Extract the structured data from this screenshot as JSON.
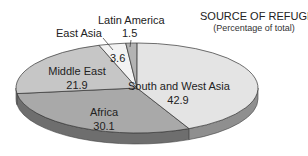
{
  "chart_data": {
    "type": "pie",
    "title": "SOURCE OF REFUGEES",
    "subtitle": "(Percentage of total)",
    "style": "3d",
    "categories": [
      "South and West Asia",
      "Africa",
      "Middle East",
      "East Asia",
      "Latin America"
    ],
    "values": [
      42.9,
      30.1,
      21.9,
      3.6,
      1.5
    ],
    "value_labels": [
      "42.9",
      "30.1",
      "21.9",
      "3.6",
      "1.5"
    ],
    "colors": [
      "#e4e4e4",
      "#a9a9a9",
      "#c6c6c6",
      "#f3f3f3",
      "#b3b3b3"
    ],
    "side_colors": [
      "#8f8f8f",
      "#6e6e6e",
      "#7c7c7c",
      "#999999",
      "#777777"
    ],
    "legend": "none",
    "labels_inline": true
  }
}
